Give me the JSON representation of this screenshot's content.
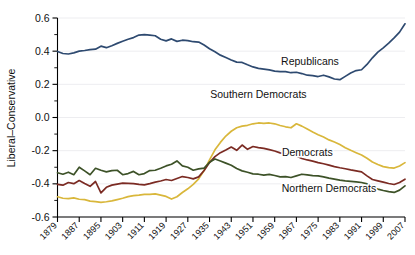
{
  "chart_data": {
    "type": "line",
    "title": "",
    "subtitle": "",
    "xlabel": "",
    "ylabel": "Liberal–Conservative",
    "xlim": [
      1879,
      2007
    ],
    "ylim": [
      -0.6,
      0.6
    ],
    "grid": true,
    "legend_position": "inline-annotations",
    "x_tick_labels": [
      "1879",
      "1887",
      "1895",
      "1903",
      "1911",
      "1919",
      "1927",
      "1935",
      "1943",
      "1951",
      "1959",
      "1967",
      "1975",
      "1983",
      "1991",
      "1999",
      "2007"
    ],
    "x_tick_values": [
      1879,
      1887,
      1895,
      1903,
      1911,
      1919,
      1927,
      1935,
      1943,
      1951,
      1959,
      1967,
      1975,
      1983,
      1991,
      1999,
      2007
    ],
    "y_tick_labels": [
      "0.6",
      "0.4",
      "0.2",
      "0.0",
      "-0.2",
      "-0.4",
      "-0.6"
    ],
    "y_tick_values": [
      0.6,
      0.4,
      0.2,
      0.0,
      -0.2,
      -0.4,
      -0.6
    ],
    "y_minor_tick_values": [
      0.5,
      0.3,
      0.1,
      -0.1,
      -0.3,
      -0.5
    ],
    "x": [
      1879,
      1881,
      1883,
      1885,
      1887,
      1889,
      1891,
      1893,
      1895,
      1897,
      1899,
      1901,
      1903,
      1905,
      1907,
      1909,
      1911,
      1913,
      1915,
      1917,
      1919,
      1921,
      1923,
      1925,
      1927,
      1929,
      1931,
      1933,
      1935,
      1937,
      1939,
      1941,
      1943,
      1945,
      1947,
      1949,
      1951,
      1953,
      1955,
      1957,
      1959,
      1961,
      1963,
      1965,
      1967,
      1969,
      1971,
      1973,
      1975,
      1977,
      1979,
      1981,
      1983,
      1985,
      1987,
      1989,
      1991,
      1993,
      1995,
      1997,
      1999,
      2001,
      2003,
      2005,
      2007
    ],
    "series": [
      {
        "name": "Republicans",
        "color": "#2e4a70",
        "label_x": 1972,
        "label_y": 0.315,
        "values": [
          0.398,
          0.386,
          0.383,
          0.39,
          0.4,
          0.404,
          0.409,
          0.412,
          0.43,
          0.421,
          0.433,
          0.447,
          0.46,
          0.472,
          0.482,
          0.497,
          0.5,
          0.497,
          0.493,
          0.472,
          0.462,
          0.474,
          0.459,
          0.466,
          0.464,
          0.457,
          0.455,
          0.437,
          0.415,
          0.396,
          0.376,
          0.362,
          0.347,
          0.334,
          0.332,
          0.318,
          0.305,
          0.296,
          0.292,
          0.287,
          0.28,
          0.277,
          0.277,
          0.27,
          0.273,
          0.265,
          0.255,
          0.252,
          0.247,
          0.255,
          0.245,
          0.232,
          0.228,
          0.248,
          0.268,
          0.283,
          0.288,
          0.32,
          0.36,
          0.394,
          0.42,
          0.448,
          0.48,
          0.515,
          0.565
        ]
      },
      {
        "name": "Southern Democrats",
        "color": "#d9b73b",
        "label_x": 1953,
        "label_y": 0.115,
        "values": [
          -0.478,
          -0.487,
          -0.489,
          -0.485,
          -0.493,
          -0.495,
          -0.504,
          -0.507,
          -0.512,
          -0.508,
          -0.503,
          -0.495,
          -0.487,
          -0.477,
          -0.471,
          -0.468,
          -0.464,
          -0.463,
          -0.461,
          -0.468,
          -0.476,
          -0.492,
          -0.478,
          -0.452,
          -0.43,
          -0.403,
          -0.37,
          -0.32,
          -0.255,
          -0.195,
          -0.15,
          -0.112,
          -0.083,
          -0.062,
          -0.052,
          -0.047,
          -0.038,
          -0.033,
          -0.035,
          -0.033,
          -0.038,
          -0.048,
          -0.056,
          -0.062,
          -0.038,
          -0.052,
          -0.07,
          -0.088,
          -0.104,
          -0.118,
          -0.135,
          -0.148,
          -0.163,
          -0.182,
          -0.198,
          -0.212,
          -0.226,
          -0.246,
          -0.268,
          -0.283,
          -0.296,
          -0.302,
          -0.305,
          -0.292,
          -0.272
        ]
      },
      {
        "name": "Democrats",
        "color": "#7b2b23",
        "label_x": 1971,
        "label_y": -0.235,
        "values": [
          -0.403,
          -0.408,
          -0.392,
          -0.399,
          -0.38,
          -0.398,
          -0.415,
          -0.386,
          -0.455,
          -0.421,
          -0.408,
          -0.402,
          -0.396,
          -0.397,
          -0.399,
          -0.403,
          -0.406,
          -0.399,
          -0.39,
          -0.383,
          -0.374,
          -0.38,
          -0.368,
          -0.356,
          -0.362,
          -0.37,
          -0.358,
          -0.32,
          -0.272,
          -0.236,
          -0.212,
          -0.196,
          -0.178,
          -0.198,
          -0.166,
          -0.192,
          -0.175,
          -0.182,
          -0.186,
          -0.194,
          -0.202,
          -0.213,
          -0.219,
          -0.226,
          -0.232,
          -0.247,
          -0.256,
          -0.263,
          -0.272,
          -0.279,
          -0.287,
          -0.296,
          -0.303,
          -0.309,
          -0.316,
          -0.322,
          -0.328,
          -0.352,
          -0.374,
          -0.382,
          -0.39,
          -0.398,
          -0.404,
          -0.392,
          -0.372
        ]
      },
      {
        "name": "Northern Democrats",
        "color": "#3d5228",
        "label_x": 1979,
        "label_y": -0.452,
        "values": [
          -0.333,
          -0.342,
          -0.33,
          -0.345,
          -0.3,
          -0.322,
          -0.345,
          -0.306,
          -0.318,
          -0.328,
          -0.32,
          -0.318,
          -0.345,
          -0.338,
          -0.325,
          -0.345,
          -0.338,
          -0.32,
          -0.318,
          -0.306,
          -0.292,
          -0.282,
          -0.262,
          -0.292,
          -0.3,
          -0.318,
          -0.31,
          -0.305,
          -0.27,
          -0.25,
          -0.262,
          -0.275,
          -0.288,
          -0.308,
          -0.322,
          -0.33,
          -0.34,
          -0.342,
          -0.348,
          -0.343,
          -0.35,
          -0.358,
          -0.356,
          -0.362,
          -0.352,
          -0.342,
          -0.346,
          -0.35,
          -0.352,
          -0.358,
          -0.366,
          -0.372,
          -0.378,
          -0.382,
          -0.385,
          -0.388,
          -0.392,
          -0.4,
          -0.42,
          -0.432,
          -0.44,
          -0.447,
          -0.452,
          -0.438,
          -0.412
        ]
      }
    ]
  }
}
